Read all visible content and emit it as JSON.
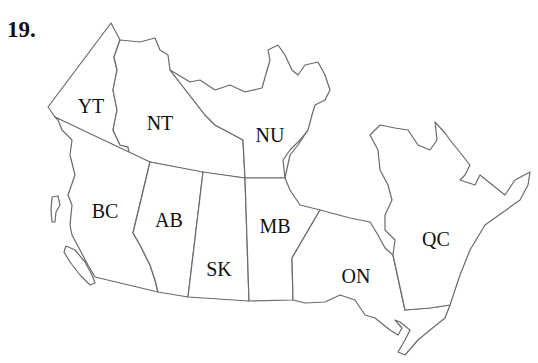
{
  "question_number": "19.",
  "map": {
    "title": "Provinces and Territories of Canada",
    "labels": [
      {
        "code": "YT",
        "x": 91,
        "y": 106
      },
      {
        "code": "NT",
        "x": 160,
        "y": 123
      },
      {
        "code": "NU",
        "x": 270,
        "y": 135
      },
      {
        "code": "BC",
        "x": 105,
        "y": 211
      },
      {
        "code": "AB",
        "x": 169,
        "y": 220
      },
      {
        "code": "SK",
        "x": 219,
        "y": 269
      },
      {
        "code": "MB",
        "x": 275,
        "y": 226
      },
      {
        "code": "ON",
        "x": 356,
        "y": 276
      },
      {
        "code": "QC",
        "x": 436,
        "y": 239
      }
    ]
  }
}
